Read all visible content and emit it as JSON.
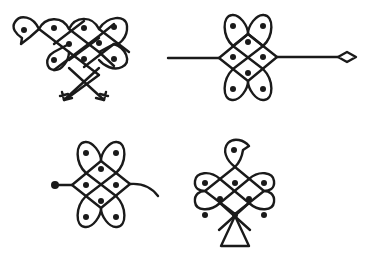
{
  "figure": {
    "stroke_color": "#1a1a1a",
    "background_color": "#ffffff",
    "motifs": [
      {
        "id": "bird-with-arrows",
        "position": "top-left",
        "dot_count": 9
      },
      {
        "id": "lattice-with-line-and-diamond",
        "position": "top-right",
        "dot_count": 7
      },
      {
        "id": "lattice-with-dot-and-tail",
        "position": "bottom-left",
        "dot_count": 7
      },
      {
        "id": "bird-on-triangle",
        "position": "bottom-right",
        "dot_count": 9
      }
    ]
  }
}
